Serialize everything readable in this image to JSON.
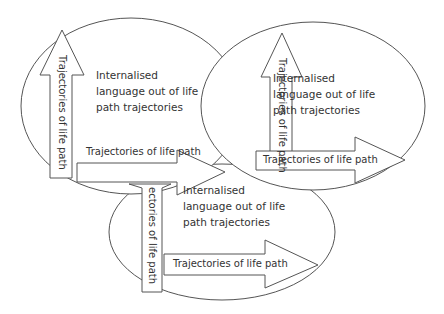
{
  "diagram": {
    "colors": {
      "stroke": "#555555",
      "text": "#333333",
      "fill": "#ffffff"
    },
    "circles": [
      {
        "id": "top-left",
        "text_lines": [
          "Internalised",
          "language out of life",
          "path trajectories"
        ],
        "vertical_arrow_label": "Trajectories of life path",
        "horizontal_arrow_label": "Trajectories of life path"
      },
      {
        "id": "top-right",
        "text_lines": [
          "Internalised",
          "language out of life",
          "path trajectories"
        ],
        "vertical_arrow_label": "Trajectories of life path",
        "horizontal_arrow_label": "Trajectories of life path"
      },
      {
        "id": "bottom",
        "text_lines": [
          "Internalised",
          "language out of life",
          "path trajectories"
        ],
        "vertical_arrow_label": "ectories of life path",
        "horizontal_arrow_label": "Trajectories of life path"
      }
    ]
  }
}
